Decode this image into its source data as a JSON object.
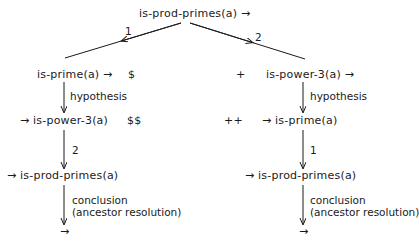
{
  "diagram": {
    "root": {
      "label": "is-prod-primes(a) →"
    },
    "edges_top": [
      {
        "label": "1",
        "direction": "left"
      },
      {
        "label": "2",
        "direction": "right"
      }
    ],
    "left_branch": {
      "node1": "is-prime(a) →",
      "marker1": "$",
      "edge1_label": "hypothesis",
      "node2": "→ is-power-3(a)",
      "marker2": "$$",
      "edge2_label": "2",
      "node3": "→ is-prod-primes(a)",
      "edge3_label_line1": "conclusion",
      "edge3_label_line2": "(ancestor resolution)",
      "node4": "→"
    },
    "right_branch": {
      "marker1": "+",
      "node1": "is-power-3(a) →",
      "edge1_label": "hypothesis",
      "marker2": "++",
      "node2": "→ is-prime(a)",
      "edge2_label": "1",
      "node3": "→ is-prod-primes(a)",
      "edge3_label_line1": "conclusion",
      "edge3_label_line2": "(ancestor resolution)",
      "node4": "→"
    }
  }
}
